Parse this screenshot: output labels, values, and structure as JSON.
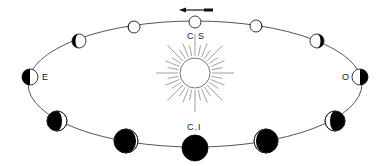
{
  "diagram": {
    "labels": {
      "superior_conjunction": "C S",
      "inferior_conjunction": "C.I",
      "east_elongation": "E",
      "west_elongation": "O"
    },
    "direction_arrow": "left",
    "colors": {
      "line": "#555555",
      "dark": "#000000",
      "light": "#ffffff",
      "rays": "#888888"
    },
    "sun": {
      "x": 195,
      "y": 73,
      "r": 15
    },
    "orbit": {
      "cx": 195,
      "cy": 84,
      "rx": 167,
      "ry": 63
    },
    "planets": [
      {
        "name": "CS",
        "x": 195,
        "y": 22,
        "r": 6,
        "dark_fraction": 0.0,
        "dark_side": "none"
      },
      {
        "name": "top-right-1",
        "x": 256,
        "y": 26,
        "r": 6,
        "dark_fraction": 0.05,
        "dark_side": "right"
      },
      {
        "name": "top-right-2",
        "x": 317,
        "y": 41,
        "r": 7,
        "dark_fraction": 0.25,
        "dark_side": "right"
      },
      {
        "name": "O",
        "x": 360,
        "y": 77,
        "r": 8,
        "dark_fraction": 0.5,
        "dark_side": "right"
      },
      {
        "name": "bottom-right-1",
        "x": 335,
        "y": 121,
        "r": 10,
        "dark_fraction": 0.75,
        "dark_side": "right"
      },
      {
        "name": "bottom-right-2",
        "x": 266,
        "y": 141,
        "r": 12,
        "dark_fraction": 0.92,
        "dark_side": "right"
      },
      {
        "name": "CI",
        "x": 195,
        "y": 148,
        "r": 13,
        "dark_fraction": 1.0,
        "dark_side": "all"
      },
      {
        "name": "bottom-left-2",
        "x": 126,
        "y": 141,
        "r": 12,
        "dark_fraction": 0.92,
        "dark_side": "left"
      },
      {
        "name": "bottom-left-1",
        "x": 57,
        "y": 121,
        "r": 10,
        "dark_fraction": 0.75,
        "dark_side": "left"
      },
      {
        "name": "E",
        "x": 30,
        "y": 77,
        "r": 8,
        "dark_fraction": 0.5,
        "dark_side": "left"
      },
      {
        "name": "top-left-2",
        "x": 79,
        "y": 41,
        "r": 7,
        "dark_fraction": 0.25,
        "dark_side": "left"
      },
      {
        "name": "top-left-1",
        "x": 134,
        "y": 27,
        "r": 6,
        "dark_fraction": 0.05,
        "dark_side": "left"
      }
    ]
  }
}
